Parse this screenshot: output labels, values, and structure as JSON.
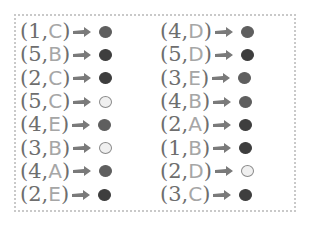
{
  "colors": {
    "dark": "#3e3e3e",
    "medium": "#5f5f5f",
    "light": "#f0f0f0",
    "number_text": "#6e6e6e",
    "letter_text": "#a6a6a6",
    "arrow": "#7a7a7a",
    "border": "#c9c9c9"
  },
  "rows": [
    {
      "left": {
        "num": "1",
        "letter": "C",
        "shade": "medium"
      },
      "right": {
        "num": "4",
        "letter": "D",
        "shade": "medium"
      }
    },
    {
      "left": {
        "num": "5",
        "letter": "B",
        "shade": "dark"
      },
      "right": {
        "num": "5",
        "letter": "D",
        "shade": "dark"
      }
    },
    {
      "left": {
        "num": "2",
        "letter": "C",
        "shade": "dark"
      },
      "right": {
        "num": "3",
        "letter": "E",
        "shade": "medium"
      }
    },
    {
      "left": {
        "num": "5",
        "letter": "C",
        "shade": "light"
      },
      "right": {
        "num": "4",
        "letter": "B",
        "shade": "medium"
      }
    },
    {
      "left": {
        "num": "4",
        "letter": "E",
        "shade": "medium"
      },
      "right": {
        "num": "2",
        "letter": "A",
        "shade": "dark"
      }
    },
    {
      "left": {
        "num": "3",
        "letter": "B",
        "shade": "light"
      },
      "right": {
        "num": "1",
        "letter": "B",
        "shade": "dark"
      }
    },
    {
      "left": {
        "num": "4",
        "letter": "A",
        "shade": "medium"
      },
      "right": {
        "num": "2",
        "letter": "D",
        "shade": "light"
      }
    },
    {
      "left": {
        "num": "2",
        "letter": "E",
        "shade": "dark"
      },
      "right": {
        "num": "3",
        "letter": "C",
        "shade": "dark"
      }
    }
  ],
  "labels": {
    "open_paren": "(",
    "comma": ",",
    "close_paren": ")"
  }
}
